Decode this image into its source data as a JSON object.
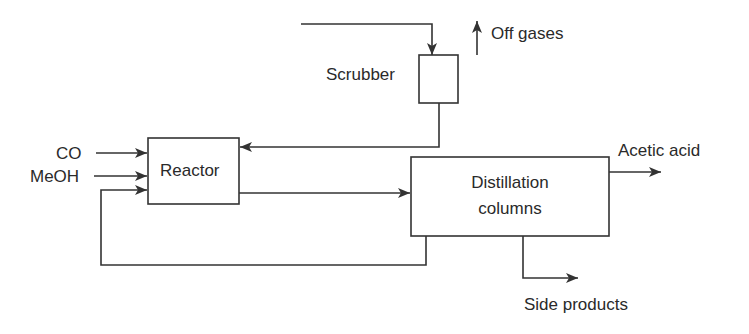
{
  "diagram": {
    "type": "process flow diagram",
    "colors": {
      "line": "#333333",
      "text": "#2a2a2a",
      "background": "#ffffff"
    },
    "units": [
      {
        "id": "scrubber",
        "label": "Scrubber"
      },
      {
        "id": "reactor",
        "label": "Reactor"
      },
      {
        "id": "distillation",
        "label_line1": "Distillation",
        "label_line2": "columns"
      }
    ],
    "streams": {
      "co": "CO",
      "meoh": "MeOH",
      "off_gases": "Off gases",
      "acetic_acid": "Acetic acid",
      "side_products": "Side products"
    },
    "connections": [
      {
        "from": "feed",
        "to": "scrubber"
      },
      {
        "from": "scrubber",
        "to": "off_gases"
      },
      {
        "from": "scrubber",
        "to": "reactor"
      },
      {
        "from": "co",
        "to": "reactor"
      },
      {
        "from": "meoh",
        "to": "reactor"
      },
      {
        "from": "reactor",
        "to": "distillation"
      },
      {
        "from": "distillation",
        "to": "acetic_acid"
      },
      {
        "from": "distillation",
        "to": "side_products"
      },
      {
        "from": "distillation",
        "to": "reactor",
        "kind": "recycle"
      }
    ]
  }
}
